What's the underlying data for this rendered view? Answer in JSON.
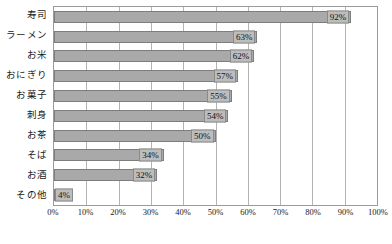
{
  "chart_data": {
    "type": "bar",
    "orientation": "horizontal",
    "title": "",
    "xlabel": "",
    "ylabel": "",
    "xlim": [
      0,
      100
    ],
    "grid": true,
    "legend": "none",
    "categories": [
      "寿司",
      "ラーメン",
      "お米",
      "おにぎり",
      "お菓子",
      "刺身",
      "お茶",
      "そば",
      "お酒",
      "その他"
    ],
    "values": [
      92,
      63,
      62,
      57,
      55,
      54,
      50,
      34,
      32,
      4
    ],
    "value_labels": [
      "92%",
      "63%",
      "62%",
      "57%",
      "55%",
      "54%",
      "50%",
      "34%",
      "32%",
      "4%"
    ],
    "xticks": [
      0,
      10,
      20,
      30,
      40,
      50,
      60,
      70,
      80,
      90,
      100
    ],
    "xtick_labels": [
      "0%",
      "10%",
      "20%",
      "30%",
      "40%",
      "50%",
      "60%",
      "70%",
      "80%",
      "90%",
      "100%"
    ],
    "colors": {
      "bar_fill": "#a9a9a9",
      "bar_border": "#7d7d7d",
      "label_fill": "#bdbdbd",
      "label_border": "#8a8a8a",
      "gridline": "#b4b4b4",
      "plot_border": "#9a9a9a",
      "background": "#ffffff",
      "text": "#1a1a1a"
    }
  }
}
